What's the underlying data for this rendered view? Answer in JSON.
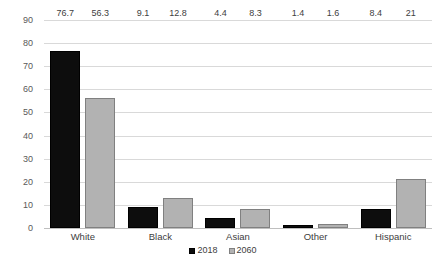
{
  "chart_data": {
    "type": "bar",
    "title": "",
    "subtitle": "",
    "xlabel": "",
    "ylabel": "",
    "categories": [
      "White",
      "Black",
      "Asian",
      "Other",
      "Hispanic"
    ],
    "series": [
      {
        "name": "2018",
        "color": "#0d0d0d",
        "values": [
          76.7,
          9.1,
          4.4,
          1.4,
          8.4
        ]
      },
      {
        "name": "2060",
        "color": "#b2b2b2",
        "values": [
          56.3,
          12.8,
          8.3,
          1.6,
          21
        ]
      }
    ],
    "value_labels": [
      [
        "76.7",
        "56.3"
      ],
      [
        "9.1",
        "12.8"
      ],
      [
        "4.4",
        "8.3"
      ],
      [
        "1.4",
        "1.6"
      ],
      [
        "8.4",
        "21"
      ]
    ],
    "ylim": [
      0,
      90
    ],
    "yticks": [
      90,
      80,
      70,
      60,
      50,
      40,
      30,
      20,
      10,
      0
    ],
    "ytick_labels": [
      "90",
      "80",
      "70",
      "60",
      "50",
      "40",
      "30",
      "20",
      "10",
      "0"
    ],
    "grid": true,
    "grid_axis": "y",
    "legend_position": "bottom",
    "legend": [
      "2018",
      "2060"
    ],
    "data_labels_shown": true
  },
  "colors": {
    "series_2018": "#0d0d0d",
    "series_2060": "#b2b2b2",
    "series_2060_border": "#808080",
    "gridline": "#d9d9d9",
    "baseline": "#bfbfbf",
    "text": "#404040",
    "axis_text": "#595959",
    "background": "#ffffff"
  }
}
